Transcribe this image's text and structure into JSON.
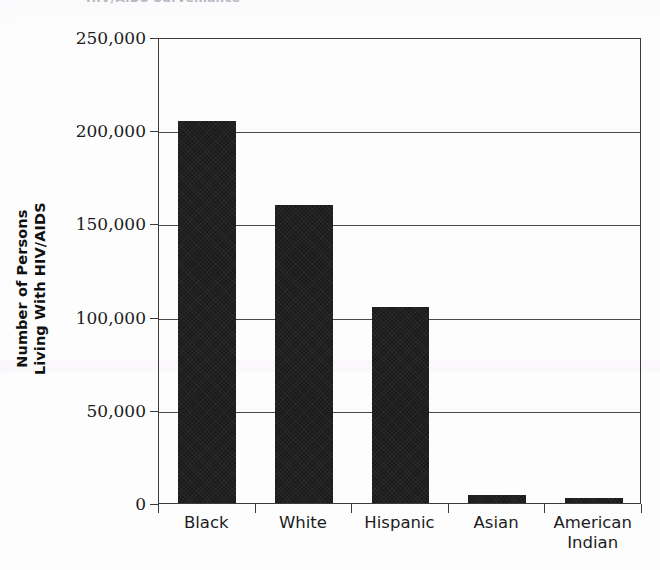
{
  "clipped_header_text": "HIV/AIDS Surveillance",
  "chart_data": {
    "type": "bar",
    "title": "",
    "subtitle": "",
    "xlabel": "",
    "ylabel_lines": [
      "Number of Persons",
      "Living With HIV/AIDS"
    ],
    "ylabel": "Number of Persons Living With HIV/AIDS",
    "categories": [
      "Black",
      "White",
      "Hispanic",
      "Asian",
      "American Indian"
    ],
    "category_label_lines": [
      [
        "Black"
      ],
      [
        "White"
      ],
      [
        "Hispanic"
      ],
      [
        "Asian"
      ],
      [
        "American",
        "Indian"
      ]
    ],
    "values": [
      205000,
      160000,
      105000,
      4300,
      2500
    ],
    "ylim": [
      0,
      250000
    ],
    "ytick_values": [
      0,
      50000,
      100000,
      150000,
      200000,
      250000
    ],
    "ytick_labels": [
      "0",
      "50,000",
      "100,000",
      "150,000",
      "200,000",
      "250,000"
    ],
    "grid": true,
    "grid_axis": "y",
    "legend": false,
    "legend_position": "none",
    "bar_color": "#1b1b1b",
    "axis_color": "#3a3a3a",
    "background_color": "#ffffff"
  }
}
